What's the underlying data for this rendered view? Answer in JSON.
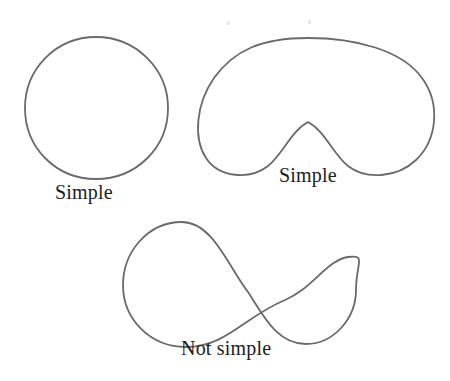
{
  "figure": {
    "background_color": "#ffffff",
    "width": 450,
    "height": 381,
    "stroke_color": "#6a6a6a",
    "text_color": "#1c1c1c"
  },
  "captions": {
    "circle": "Simple",
    "bean": "Simple",
    "figure_eight": "Not simple"
  },
  "shapes": [
    {
      "name": "circle-curve",
      "label": "Simple",
      "description": "closed circular curve",
      "self_intersecting": false,
      "center": [
        96,
        108
      ],
      "radius": 71
    },
    {
      "name": "bean-curve",
      "label": "Simple",
      "description": "closed kidney bean shaped curve with concave notch",
      "self_intersecting": false,
      "bounds": [
        200,
        38,
        433,
        178
      ],
      "notch_peak": [
        308,
        122
      ]
    },
    {
      "name": "figure-eight-curve",
      "label": "Not simple",
      "description": "closed figure eight curve crossing itself once",
      "self_intersecting": true,
      "bounds": [
        123,
        222,
        356,
        347
      ],
      "crossing_point": [
        248,
        292
      ],
      "left_loop_center": [
        186,
        283
      ],
      "right_loop_center": [
        305,
        295
      ]
    }
  ]
}
